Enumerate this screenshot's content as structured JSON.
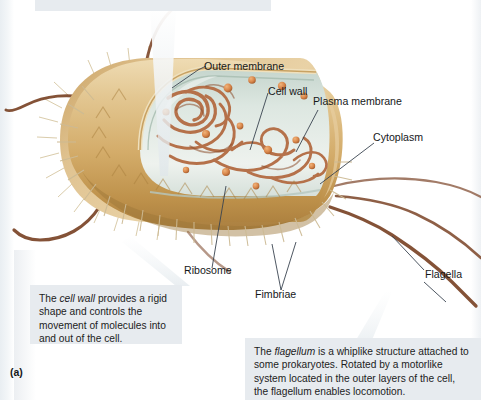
{
  "figure": {
    "letter": "(a)"
  },
  "captions": {
    "top": {
      "text": "",
      "note": "cut off at top edge of screenshot"
    },
    "cell_wall": {
      "line1_a": "The ",
      "line1_em": "cell wall",
      "line1_b": " provides a rigid",
      "line2": "shape and controls the",
      "line3": "movement of molecules",
      "line4": "into and out of the cell."
    },
    "flagellum": {
      "line1_a": "The ",
      "line1_em": "flagellum",
      "line1_b": " is a whiplike structure attached",
      "line2": "to some prokaryotes. Rotated by a motorlike",
      "line3": "system located in the outer layers of the cell,",
      "line4": "the flagellum enables locomotion."
    }
  },
  "labels": [
    {
      "id": "outer-membrane",
      "text": "Outer membrane"
    },
    {
      "id": "cell-wall",
      "text": "Cell wall"
    },
    {
      "id": "plasma-membrane",
      "text": "Plasma membrane"
    },
    {
      "id": "cytoplasm",
      "text": "Cytoplasm"
    },
    {
      "id": "ribosome",
      "text": "Ribosome"
    },
    {
      "id": "fimbriae",
      "text": "Fimbriae"
    },
    {
      "id": "flagella",
      "text": "Flagella"
    }
  ],
  "colors": {
    "page_background": "#ffffff",
    "caption_background": "#e7ebef",
    "caption_text": "#1c1c1c",
    "leader_line": "#3a4450",
    "cell_wall_light": "#e2c793",
    "cell_wall_mid": "#cfa862",
    "cell_wall_dark": "#b08845",
    "cell_wall_shadow": "#9a7237",
    "cytoplasm": "#d7e2dc",
    "cytoplasm_edge": "#b9cbc4",
    "dna_strand": "#b5714a",
    "dna_strand_dark": "#8d4f2e",
    "ribosome_granule": "#d98a4e",
    "flagellum": "#7a4326",
    "fimbriae": "#d8c9a8",
    "pointer_wedge": "#eef1f3"
  }
}
